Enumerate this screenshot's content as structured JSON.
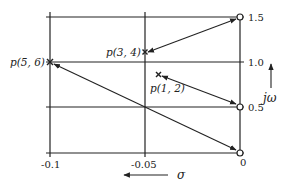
{
  "diagram": {
    "type": "pole-zero-plane-mapping",
    "colors": {
      "line": "#222222",
      "background": "#ffffff"
    },
    "x_axis": {
      "label": "σ",
      "direction_arrow": "left",
      "ticks": [
        "-0.1",
        "-0.05",
        "0"
      ]
    },
    "y_axis": {
      "label": "jω",
      "direction_arrow": "up",
      "ticks": [
        "0",
        "0.5",
        "1.0",
        "1.5"
      ]
    },
    "points": [
      {
        "id": "p56",
        "label": "p(5, 6)",
        "marker": "x",
        "sigma": -0.1,
        "jw": 1.0
      },
      {
        "id": "p34",
        "label": "p(3, 4)",
        "marker": "x",
        "sigma": -0.05,
        "jw": 1.2
      },
      {
        "id": "p12",
        "label": "p(1, 2)",
        "marker": "x",
        "sigma": -0.04,
        "jw": 0.92
      }
    ],
    "zeros": [
      {
        "id": "z15",
        "marker": "o",
        "sigma": 0,
        "jw": 1.5
      },
      {
        "id": "z05",
        "marker": "o",
        "sigma": 0,
        "jw": 0.5
      },
      {
        "id": "z0",
        "marker": "o",
        "sigma": 0,
        "jw": 0
      }
    ],
    "arrows": [
      {
        "from": "z15",
        "to": "p34",
        "bidirectional": true
      },
      {
        "from": "z05",
        "to": "p12",
        "bidirectional": true
      },
      {
        "from": "z0",
        "to": "p56",
        "bidirectional": true
      }
    ],
    "tick_labels": {
      "x_m01": "-0.1",
      "x_m005": "-0.05",
      "x_0": "0",
      "y_15": "1.5",
      "y_10": "1.0",
      "y_05": "0.5"
    },
    "point_labels": {
      "p56": "p(5, 6)",
      "p34": "p(3, 4)",
      "p12": "p(1, 2)"
    },
    "axis_labels": {
      "sigma": "σ",
      "jw": "jω"
    }
  }
}
